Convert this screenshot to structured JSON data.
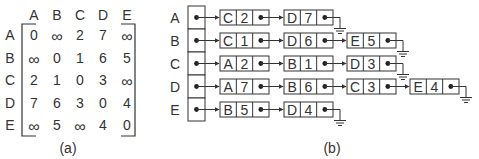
{
  "matrix": {
    "caption": "(a)",
    "col_headers": [
      "A",
      "B",
      "C",
      "D",
      "E"
    ],
    "row_headers": [
      "A",
      "B",
      "C",
      "D",
      "E"
    ],
    "cells": [
      [
        "0",
        "∞",
        "2",
        "7",
        "∞"
      ],
      [
        "∞",
        "0",
        "1",
        "6",
        "5"
      ],
      [
        "2",
        "1",
        "0",
        "3",
        "∞"
      ],
      [
        "7",
        "6",
        "3",
        "0",
        "4"
      ],
      [
        "∞",
        "5",
        "∞",
        "4",
        "0"
      ]
    ]
  },
  "adjacency_list": {
    "caption": "(b)",
    "rows": [
      {
        "vertex": "A",
        "nodes": [
          {
            "vertex": "C",
            "weight": "2"
          },
          {
            "vertex": "D",
            "weight": "7"
          }
        ]
      },
      {
        "vertex": "B",
        "nodes": [
          {
            "vertex": "C",
            "weight": "1"
          },
          {
            "vertex": "D",
            "weight": "6"
          },
          {
            "vertex": "E",
            "weight": "5"
          }
        ]
      },
      {
        "vertex": "C",
        "nodes": [
          {
            "vertex": "A",
            "weight": "2"
          },
          {
            "vertex": "B",
            "weight": "1"
          },
          {
            "vertex": "D",
            "weight": "3"
          }
        ]
      },
      {
        "vertex": "D",
        "nodes": [
          {
            "vertex": "A",
            "weight": "7"
          },
          {
            "vertex": "B",
            "weight": "6"
          },
          {
            "vertex": "C",
            "weight": "3"
          },
          {
            "vertex": "E",
            "weight": "4"
          }
        ]
      },
      {
        "vertex": "E",
        "nodes": [
          {
            "vertex": "B",
            "weight": "5"
          },
          {
            "vertex": "D",
            "weight": "4"
          }
        ]
      }
    ]
  },
  "colors": {
    "ink": "#333333",
    "background": "#ffffff"
  }
}
